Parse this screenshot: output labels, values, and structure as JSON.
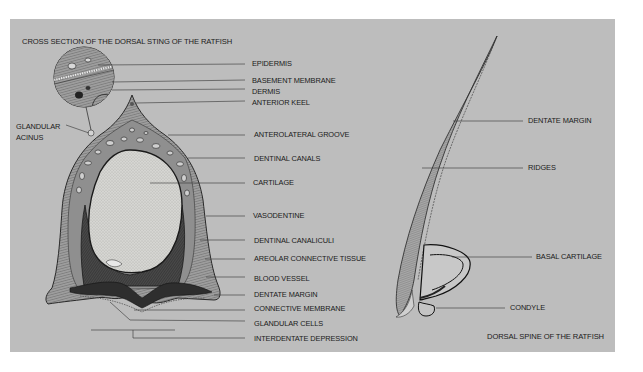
{
  "left_figure": {
    "title": "CROSS SECTION OF THE DORSAL STING OF THE RATFISH",
    "side_label": [
      "GLANDULAR",
      "ACINUS"
    ],
    "labels": [
      "EPIDERMIS",
      "BASEMENT MEMBRANE",
      "DERMIS",
      "ANTERIOR KEEL",
      "ANTEROLATERAL GROOVE",
      "DENTINAL CANALS",
      "CARTILAGE",
      "VASODENTINE",
      "DENTINAL CANALICULI",
      "AREOLAR CONNECTIVE TISSUE",
      "BLOOD VESSEL",
      "DENTATE MARGIN",
      "CONNECTIVE MEMBRANE",
      "GLANDULAR CELLS",
      "INTERDENTATE DEPRESSION"
    ]
  },
  "right_figure": {
    "title": "DORSAL SPINE OF THE RATFISH",
    "labels": [
      "DENTATE MARGIN",
      "RIDGES",
      "BASAL CARTILAGE",
      "CONDYLE"
    ]
  },
  "colors": {
    "panel_background": "#bdbdbd",
    "ink": "#1a1a1a",
    "cartilage": "#d9d9d6",
    "tissue_dark": "#3a3a3a"
  }
}
